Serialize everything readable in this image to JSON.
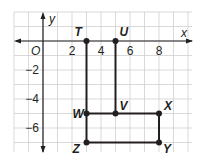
{
  "figure": {
    "axes": {
      "x_label": "x",
      "y_label": "y",
      "origin_label": "O",
      "x_ticks": [
        {
          "value": 2,
          "label": "2"
        },
        {
          "value": 4,
          "label": "4"
        },
        {
          "value": 6,
          "label": "6"
        },
        {
          "value": 8,
          "label": "8"
        }
      ],
      "y_ticks": [
        {
          "value": -2,
          "label": "−2"
        },
        {
          "value": -4,
          "label": "−4"
        },
        {
          "value": -6,
          "label": "−6"
        }
      ],
      "x_range": [
        -2,
        10
      ],
      "y_range": [
        2,
        -7.5
      ]
    },
    "points": [
      {
        "name": "T",
        "x": 3,
        "y": 0
      },
      {
        "name": "U",
        "x": 5,
        "y": 0
      },
      {
        "name": "V",
        "x": 5,
        "y": -5
      },
      {
        "name": "W",
        "x": 3,
        "y": -5
      },
      {
        "name": "X",
        "x": 8,
        "y": -5
      },
      {
        "name": "Y",
        "x": 8,
        "y": -7
      },
      {
        "name": "Z",
        "x": 3,
        "y": -7
      }
    ],
    "segments": [
      [
        "T",
        "W"
      ],
      [
        "U",
        "V"
      ],
      [
        "W",
        "X"
      ],
      [
        "X",
        "Y"
      ],
      [
        "Y",
        "Z"
      ],
      [
        "Z",
        "W"
      ]
    ],
    "colors": {
      "grid": "#cfcfcf",
      "axes": "#231f20",
      "segments": "#231f20",
      "points": "#231f20"
    }
  }
}
